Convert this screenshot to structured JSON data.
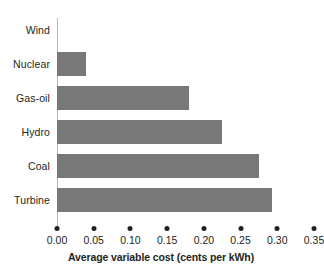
{
  "chart_data": {
    "type": "bar",
    "orientation": "horizontal",
    "title": "",
    "subtitle": "",
    "xlabel": "Average variable cost (cents per kWh)",
    "ylabel": "",
    "categories": [
      "Wind",
      "Nuclear",
      "Gas-oil",
      "Hydro",
      "Coal",
      "Turbine"
    ],
    "values": [
      0.0,
      0.04,
      0.18,
      0.225,
      0.275,
      0.293
    ],
    "xlim": [
      0.0,
      0.35
    ],
    "xticks": [
      0.0,
      0.05,
      0.1,
      0.15,
      0.2,
      0.25,
      0.3,
      0.35
    ],
    "xtick_labels": [
      "0.00",
      "0.05",
      "0.10",
      "0.15",
      "0.20",
      "0.25",
      "0.30",
      "0.35"
    ],
    "grid": false,
    "legend": false,
    "legend_position": "none",
    "bar_color": "#787878",
    "text_color": "#231f20",
    "background_color": "#ffffff",
    "tick_marker": "dot"
  }
}
